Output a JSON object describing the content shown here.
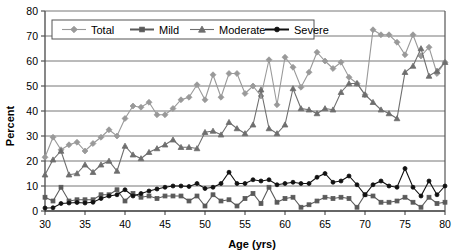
{
  "chart_data": {
    "type": "line",
    "title": "",
    "xlabel": "Age (yrs)",
    "ylabel": "Percent",
    "xlim": [
      30,
      80
    ],
    "ylim": [
      0,
      80
    ],
    "xticks": [
      30,
      35,
      40,
      45,
      50,
      55,
      60,
      65,
      70,
      75,
      80
    ],
    "yticks": [
      0,
      10,
      20,
      30,
      40,
      50,
      60,
      70,
      80
    ],
    "grid": "horizontal",
    "legend_position": "top-left",
    "x": [
      30,
      31,
      32,
      33,
      34,
      35,
      36,
      37,
      38,
      39,
      40,
      41,
      42,
      43,
      44,
      45,
      46,
      47,
      48,
      49,
      50,
      51,
      52,
      53,
      54,
      55,
      56,
      57,
      58,
      59,
      60,
      61,
      62,
      63,
      64,
      65,
      66,
      67,
      68,
      69,
      70,
      71,
      72,
      73,
      74,
      75,
      76,
      77,
      78,
      79,
      80
    ],
    "series": [
      {
        "name": "Total",
        "marker": "diamond",
        "color": "#999999",
        "values": [
          21.5,
          29.5,
          24.5,
          26.5,
          27.5,
          24.0,
          27.0,
          29.5,
          32.5,
          30.0,
          37.0,
          42.0,
          41.5,
          43.5,
          38.5,
          38.5,
          41.0,
          44.5,
          45.5,
          50.5,
          44.5,
          54.5,
          45.5,
          55.0,
          55.0,
          47.0,
          50.0,
          46.0,
          60.5,
          42.5,
          61.5,
          57.5,
          49.5,
          55.5,
          63.5,
          60.0,
          57.0,
          59.5,
          53.5,
          51.0,
          46.5,
          72.5,
          70.5,
          70.5,
          67.5,
          62.5,
          70.5,
          62.0,
          65.5,
          55.0,
          59.5
        ]
      },
      {
        "name": "Moderate",
        "marker": "triangle",
        "color": "#6e6e6e",
        "values": [
          14.5,
          20.5,
          24.0,
          14.5,
          15.0,
          18.5,
          15.5,
          18.5,
          20.0,
          16.0,
          26.0,
          22.5,
          21.0,
          23.5,
          25.0,
          26.5,
          28.5,
          25.5,
          25.5,
          25.0,
          31.5,
          32.0,
          30.5,
          35.5,
          33.0,
          31.0,
          34.5,
          48.5,
          33.0,
          31.0,
          34.5,
          49.0,
          41.0,
          40.5,
          39.0,
          41.0,
          40.5,
          47.5,
          51.0,
          51.0,
          46.5,
          43.5,
          40.5,
          39.0,
          37.0,
          55.5,
          58.0,
          65.0,
          54.0,
          56.0,
          59.5
        ]
      },
      {
        "name": "Severe",
        "marker": "circle",
        "color": "#111111",
        "values": [
          1.2,
          1.3,
          3.0,
          3.2,
          3.4,
          3.2,
          3.5,
          5.0,
          6.0,
          6.5,
          8.5,
          6.0,
          7.0,
          8.0,
          8.8,
          9.5,
          10.0,
          10.0,
          9.8,
          11.0,
          9.0,
          9.5,
          11.0,
          15.5,
          11.0,
          11.0,
          12.5,
          12.0,
          12.5,
          10.5,
          11.0,
          11.5,
          11.0,
          11.0,
          13.5,
          15.0,
          11.5,
          12.0,
          14.0,
          10.5,
          6.5,
          10.5,
          12.0,
          10.0,
          9.5,
          17.0,
          9.5,
          6.0,
          12.0,
          6.5,
          10.0
        ]
      },
      {
        "name": "Mild",
        "marker": "square",
        "color": "#5a5a5a",
        "values": [
          5.5,
          4.0,
          9.5,
          4.0,
          4.5,
          4.5,
          4.5,
          6.5,
          6.5,
          8.5,
          4.0,
          7.0,
          5.5,
          6.0,
          5.0,
          6.0,
          6.0,
          6.0,
          4.0,
          6.0,
          2.0,
          6.5,
          4.0,
          4.5,
          2.0,
          5.0,
          7.0,
          3.0,
          9.5,
          3.5,
          5.0,
          5.5,
          1.5,
          2.5,
          4.0,
          5.5,
          5.0,
          5.5,
          5.0,
          1.5,
          6.5,
          6.0,
          3.5,
          3.5,
          4.0,
          5.5,
          3.5,
          1.5,
          5.5,
          3.0,
          3.5
        ]
      }
    ],
    "legend": [
      {
        "label": "Total",
        "marker": "diamond",
        "color": "#999999"
      },
      {
        "label": "Mild",
        "marker": "square",
        "color": "#5a5a5a"
      },
      {
        "label": "Moderate",
        "marker": "triangle",
        "color": "#6e6e6e"
      },
      {
        "label": "Severe",
        "marker": "circle",
        "color": "#111111"
      }
    ]
  }
}
